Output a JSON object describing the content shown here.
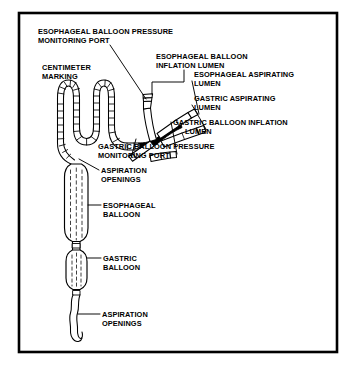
{
  "figure": {
    "kind": "medical-illustration",
    "frame": {
      "border_color": "#000000",
      "background_color": "#ffffff",
      "ink_color": "#000000"
    },
    "labels": [
      {
        "id": "esophageal-balloon-pressure-monitoring-port",
        "line1": "ESOPHAGEAL BALLOON PRESSURE",
        "line2": "MONITORING PORT",
        "x": 38,
        "y": 27
      },
      {
        "id": "esophageal-balloon-inflation-lumen",
        "line1": "ESOPHAGEAL BALLOON",
        "line2": "INFLATION LUMEN",
        "x": 156,
        "y": 52
      },
      {
        "id": "centimeter-marking",
        "line1": "CENTIMETER",
        "line2": "MARKING",
        "x": 42,
        "y": 63
      },
      {
        "id": "esophageal-aspirating-lumen",
        "line1": "ESOPHAGEAL ASPIRATING",
        "line2": "LUMEN",
        "x": 194,
        "y": 70
      },
      {
        "id": "gastric-aspirating-lumen",
        "line1": "GASTRIC ASPIRATING",
        "line2": "LUMEN",
        "x": 194,
        "y": 94
      },
      {
        "id": "gastric-balloon-inflation-lumen",
        "line1": "GASTRIC BALLOON INFLATION",
        "line2": "LUMEN",
        "x": 173,
        "y": 118
      },
      {
        "id": "gastric-balloon-pressure-monitoring-port",
        "line1": "GASTRIC BALLOON PRESSURE",
        "line2": "MONITORING PORT",
        "x": 98,
        "y": 142
      },
      {
        "id": "aspiration-openings-proximal",
        "line1": "ASPIRATION",
        "line2": "OPENINGS",
        "x": 101,
        "y": 166
      },
      {
        "id": "esophageal-balloon",
        "line1": "ESOPHAGEAL",
        "line2": "BALLOON",
        "x": 103,
        "y": 201
      },
      {
        "id": "gastric-balloon",
        "line1": "GASTRIC",
        "line2": "BALLOON",
        "x": 103,
        "y": 254
      },
      {
        "id": "aspiration-openings-distal",
        "line1": "ASPIRATION",
        "line2": "OPENINGS",
        "x": 102,
        "y": 310
      }
    ],
    "parts": [
      "coiled proximal tubing with centimeter tick marks",
      "four-port branching connector manifold",
      "esophageal balloon (long cylinder)",
      "gastric balloon (short oval)",
      "wavy distal catheter tip with aspiration openings"
    ]
  }
}
